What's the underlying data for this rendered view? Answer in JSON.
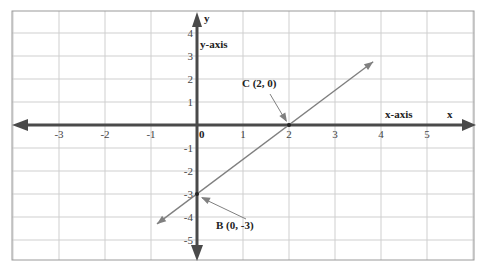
{
  "chart_data": {
    "type": "line",
    "title": "",
    "xlabel": "x",
    "ylabel": "y",
    "x_axis_label": "x-axis",
    "y_axis_label": "y-axis",
    "xlim": [
      -4,
      6
    ],
    "ylim": [
      -5.7,
      5
    ],
    "grid": true,
    "x_ticks": [
      -3,
      -2,
      -1,
      0,
      1,
      2,
      3,
      4,
      5
    ],
    "x_tick_labels": [
      "-3",
      "-2",
      "-1",
      "0",
      "1",
      "2",
      "3",
      "4",
      "5"
    ],
    "y_ticks": [
      4,
      3,
      2,
      1,
      -1,
      -2,
      -3,
      -4,
      -5
    ],
    "y_tick_labels": [
      "4",
      "3",
      "2",
      "1",
      "-1",
      "-2",
      "-3",
      "-4",
      "-5"
    ],
    "series": [
      {
        "name": "y = 1.5x - 3",
        "x": [
          -0.87,
          3.83
        ],
        "y": [
          -4.3,
          2.75
        ],
        "color": "#808080"
      }
    ],
    "points": [
      {
        "label": "C (2, 0)",
        "x": 2,
        "y": 0
      },
      {
        "label": "B (0, -3)",
        "x": 0,
        "y": -3
      }
    ],
    "annotations": [
      "C (2, 0)",
      "B (0, -3)",
      "x-axis",
      "y-axis",
      "x",
      "y"
    ]
  },
  "colors": {
    "axis": "#4a4a4a",
    "grid": "#cfcfcf",
    "line": "#808080",
    "border": "#9a9a9a"
  }
}
